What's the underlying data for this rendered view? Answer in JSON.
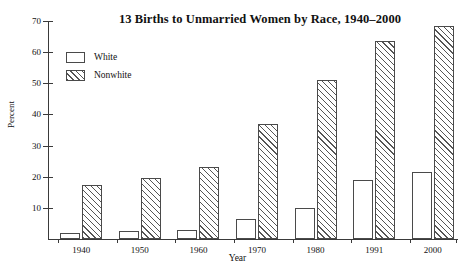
{
  "chart_data": {
    "type": "bar",
    "title": "13  Births to Unmarried Women by Race, 1940–2000",
    "xlabel": "Year",
    "ylabel": "Percent",
    "categories": [
      "1940",
      "1950",
      "1960",
      "1970",
      "1980",
      "1991",
      "2000"
    ],
    "series": [
      {
        "name": "White",
        "values": [
          2,
          2.5,
          3,
          6.5,
          10,
          19,
          21.5
        ]
      },
      {
        "name": "Nonwhite",
        "values": [
          17.5,
          19.5,
          23,
          37,
          51,
          63.5,
          68.5
        ]
      }
    ],
    "ylim": [
      0,
      70
    ],
    "yticks": [
      10,
      20,
      30,
      40,
      50,
      60,
      70
    ],
    "ytick_labels": [
      "10",
      "20",
      "30",
      "40",
      "50",
      "60",
      "70"
    ],
    "grid": false,
    "legend_position": "top-left",
    "legend": [
      {
        "label": "White",
        "pattern": "open"
      },
      {
        "label": "Nonwhite",
        "pattern": "diagonal-hatch"
      }
    ],
    "colors": {
      "axis": "#3a3a3a",
      "bar_border": "#4a4a4a",
      "bar_fill": "#ffffff",
      "hatch": "#555555",
      "text": "#111111",
      "background": "#ffffff"
    }
  }
}
